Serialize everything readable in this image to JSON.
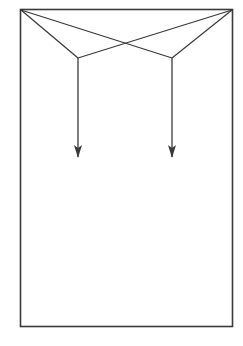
{
  "diagram": {
    "stroke_color": "#3a3a3a",
    "background_color": "#ffffff",
    "elements": [
      {
        "id": "frame",
        "type": "rectangle"
      },
      {
        "id": "left-corner-to-left-vertex",
        "type": "line"
      },
      {
        "id": "right-corner-to-right-vertex",
        "type": "line"
      },
      {
        "id": "left-corner-to-right-vertex",
        "type": "line"
      },
      {
        "id": "right-corner-to-left-vertex",
        "type": "line"
      },
      {
        "id": "left-arrow",
        "type": "arrow",
        "direction": "down"
      },
      {
        "id": "right-arrow",
        "type": "arrow",
        "direction": "down"
      }
    ]
  }
}
